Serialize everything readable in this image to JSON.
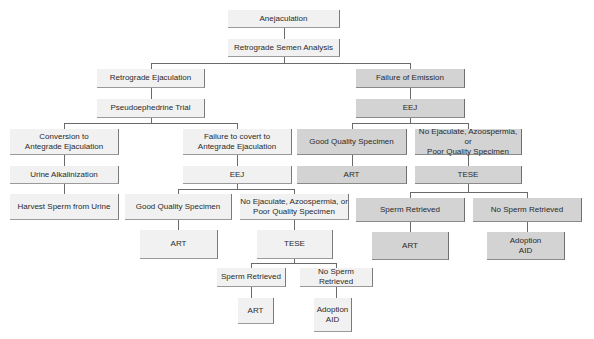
{
  "diagram": {
    "colors": {
      "unshaded": "#f1f1f1",
      "shaded": "#d3d3d3",
      "connector": "#6a6a6a",
      "text": "#2a2a2a"
    },
    "nodes": {
      "root": "Anejaculation",
      "analysis": "Retrograde Semen Analysis",
      "retro": "Retrograde Ejaculation",
      "foe": "Failure of Emission",
      "pseudo": "Pseudoephedrine Trial",
      "eej_r": "EEJ",
      "conv": "Conversion to\nAntegrade Ejaculation",
      "fail_conv": "Failure to covert to\nAntegrade Ejaculation",
      "good_r": "Good Quality Specimen",
      "noej_r": "No Ejaculate, Azoospermia, or\nPoor Quality Specimen",
      "urine": "Urine Alkalinization",
      "eej_l": "EEJ",
      "art_r1": "ART",
      "tese_r": "TESE",
      "harvest": "Harvest Sperm from Urine",
      "good_l": "Good Quality Specimen",
      "noej_l": "No Ejaculate, Azoospermia, or\nPoor Quality Specimen",
      "sperm_r": "Sperm Retrieved",
      "nosperm_r": "No Sperm Retrieved",
      "art_l1": "ART",
      "tese_l": "TESE",
      "art_r2": "ART",
      "adopt_r": "Adoption\nAID",
      "sperm_l": "Sperm Retrieved",
      "nosperm_l": "No Sperm Retrieved",
      "art_l2": "ART",
      "adopt_l": "Adoption\nAID"
    }
  }
}
